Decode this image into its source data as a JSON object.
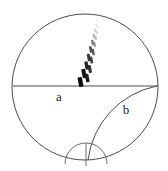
{
  "figure": {
    "type": "geometric-diagram",
    "width": 168,
    "height": 171,
    "background_color": "#ffffff",
    "stroke_color": "#4a4a4a",
    "dash_color_dark": "#111111",
    "dash_color_faint": "#bcbcbc",
    "label_color": "#1a1a1a"
  },
  "labels": {
    "region_a": "a",
    "region_b": "b"
  },
  "shapes": {
    "outer_circle": {
      "name": "outer-circle",
      "cx": 85,
      "cy": 87,
      "r": 73
    },
    "horizontal_diameter": {
      "name": "horizontal-diameter",
      "x1": 13,
      "y1": 86,
      "x2": 158,
      "y2": 86
    },
    "lens_arc": {
      "name": "lens-arc",
      "start_x": 157,
      "start_y": 86,
      "end_x": 88,
      "end_y": 160,
      "sweep": "concave-left"
    },
    "bottom_semicircle": {
      "name": "bottom-semicircle",
      "cx": 86,
      "cy": 164,
      "r": 21,
      "span": "upper-half"
    },
    "vertical_tick": {
      "name": "vertical-tick",
      "x1": 86,
      "y1": 143,
      "x2": 86,
      "y2": 166
    }
  },
  "dash_trail": {
    "name": "dashed-trajectory",
    "description": "slanted dash marks fading from dark at bottom to faint at top",
    "marks": [
      {
        "x": 80.5,
        "y": 82.0,
        "w": 4.4,
        "h": 9.5,
        "angle": -11,
        "color": "#0d0d0d",
        "opacity": 1.0
      },
      {
        "x": 84.0,
        "y": 73.5,
        "w": 4.0,
        "h": 9.0,
        "angle": -11,
        "color": "#141414",
        "opacity": 1.0
      },
      {
        "x": 87.2,
        "y": 78.0,
        "w": 3.6,
        "h": 8.4,
        "angle": -11,
        "color": "#151515",
        "opacity": 0.97
      },
      {
        "x": 86.6,
        "y": 65.5,
        "w": 3.4,
        "h": 8.2,
        "angle": -11,
        "color": "#1a1a1a",
        "opacity": 0.95
      },
      {
        "x": 89.8,
        "y": 69.0,
        "w": 3.2,
        "h": 7.8,
        "angle": -11,
        "color": "#1e1e1e",
        "opacity": 0.93
      },
      {
        "x": 88.8,
        "y": 57.5,
        "w": 3.0,
        "h": 7.4,
        "angle": -11,
        "color": "#242424",
        "opacity": 0.9
      },
      {
        "x": 91.4,
        "y": 60.0,
        "w": 2.8,
        "h": 7.0,
        "angle": -11,
        "color": "#2b2b2b",
        "opacity": 0.88
      },
      {
        "x": 90.8,
        "y": 49.5,
        "w": 2.7,
        "h": 6.6,
        "angle": -11,
        "color": "#333333",
        "opacity": 0.85
      },
      {
        "x": 93.2,
        "y": 52.0,
        "w": 2.5,
        "h": 6.2,
        "angle": -11,
        "color": "#3d3d3d",
        "opacity": 0.82
      },
      {
        "x": 92.6,
        "y": 42.5,
        "w": 2.4,
        "h": 5.6,
        "angle": -11,
        "color": "#545454",
        "opacity": 0.75
      },
      {
        "x": 94.6,
        "y": 44.5,
        "w": 2.2,
        "h": 5.2,
        "angle": -11,
        "color": "#6a6a6a",
        "opacity": 0.7
      },
      {
        "x": 94.0,
        "y": 36.0,
        "w": 2.1,
        "h": 4.8,
        "angle": -11,
        "color": "#828282",
        "opacity": 0.62
      },
      {
        "x": 95.8,
        "y": 38.0,
        "w": 2.0,
        "h": 4.4,
        "angle": -11,
        "color": "#949494",
        "opacity": 0.58
      },
      {
        "x": 95.2,
        "y": 30.5,
        "w": 1.9,
        "h": 4.0,
        "angle": -11,
        "color": "#a5a5a5",
        "opacity": 0.52
      },
      {
        "x": 96.8,
        "y": 32.5,
        "w": 1.8,
        "h": 3.8,
        "angle": -11,
        "color": "#b0b0b0",
        "opacity": 0.48
      },
      {
        "x": 96.2,
        "y": 25.0,
        "w": 1.7,
        "h": 3.4,
        "angle": -11,
        "color": "#bdbdbd",
        "opacity": 0.42
      },
      {
        "x": 97.6,
        "y": 27.0,
        "w": 1.6,
        "h": 3.2,
        "angle": -11,
        "color": "#c4c4c4",
        "opacity": 0.38
      },
      {
        "x": 97.0,
        "y": 20.5,
        "w": 1.5,
        "h": 3.0,
        "angle": -11,
        "color": "#cccccc",
        "opacity": 0.33
      },
      {
        "x": 98.2,
        "y": 22.5,
        "w": 1.4,
        "h": 2.8,
        "angle": -11,
        "color": "#d2d2d2",
        "opacity": 0.3
      },
      {
        "x": 97.8,
        "y": 16.8,
        "w": 1.3,
        "h": 2.5,
        "angle": -11,
        "color": "#dadada",
        "opacity": 0.26
      },
      {
        "x": 98.8,
        "y": 18.6,
        "w": 1.2,
        "h": 2.3,
        "angle": -11,
        "color": "#e0e0e0",
        "opacity": 0.22
      }
    ]
  }
}
